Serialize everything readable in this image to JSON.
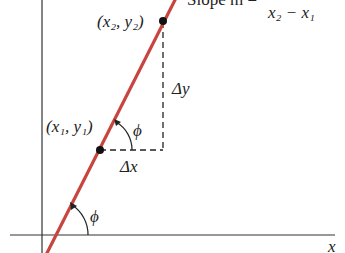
{
  "diagram": {
    "slope_label_prefix": "Slope m =",
    "slope_denominator": "x₂ − x₁",
    "point2": "(x₂, y₂)",
    "point1": "(x₁, y₁)",
    "delta_y": "Δy",
    "delta_x": "Δx",
    "angle_upper": "ϕ",
    "angle_lower": "ϕ",
    "x_axis_label": "x",
    "colors": {
      "line": "#c8443f",
      "axis": "#333333",
      "dashed": "#222222",
      "text": "#222222"
    }
  }
}
